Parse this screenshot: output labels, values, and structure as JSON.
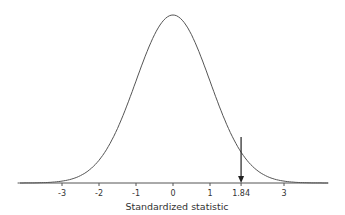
{
  "chart_data": {
    "type": "line",
    "title": "",
    "xlabel": "Standardized statistic",
    "ylabel": "",
    "x_ticks": [
      -3,
      -2,
      -1,
      0,
      1,
      1.84,
      3
    ],
    "tick_labels": [
      "-3",
      "-2",
      "-1",
      "0",
      "1",
      "1.84",
      "3"
    ],
    "xlim": [
      -4.2,
      4.2
    ],
    "grid": false,
    "annotations": [
      {
        "type": "arrow",
        "x": 1.84,
        "label": "1.84"
      }
    ],
    "series": [
      {
        "name": "Standard normal density",
        "mean": 0,
        "sd": 1
      }
    ]
  }
}
